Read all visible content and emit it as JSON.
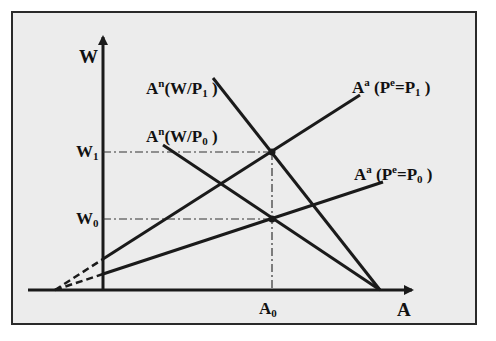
{
  "diagram": {
    "type": "economics-labor-market",
    "axes": {
      "y_label": "W",
      "x_label": "A"
    },
    "ticks": {
      "w1": {
        "base": "W",
        "sub": "1"
      },
      "w0": {
        "base": "W",
        "sub": "0"
      },
      "a0": {
        "base": "A",
        "sub": "0"
      }
    },
    "curves": [
      {
        "id": "demand_p1",
        "base": "A",
        "sup": "n",
        "text": "(W/P",
        "sub": "1",
        "close": " )"
      },
      {
        "id": "demand_p0",
        "base": "A",
        "sup": "n",
        "text": "(W/P",
        "sub": "0",
        "close": " )"
      },
      {
        "id": "supply_p1",
        "base": "A",
        "sup": "a",
        "text": " (P",
        "sup2": "e",
        "mid": "=P",
        "sub": "1",
        "close": " )"
      },
      {
        "id": "supply_p0",
        "base": "A",
        "sup": "a",
        "text": " (P",
        "sup2": "e",
        "mid": "=P",
        "sub": "0",
        "close": " )"
      }
    ],
    "colors": {
      "background": "#ececec",
      "line": "#1a1a1a",
      "frame": "#2a2a2a"
    }
  }
}
